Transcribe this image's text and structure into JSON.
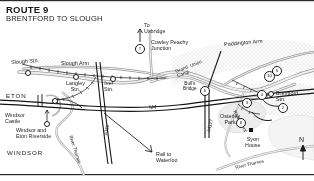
{
  "header": {
    "route_label": "ROUTE 9",
    "route_title": "BRENTFORD TO SLOUGH"
  },
  "map": {
    "north_indicator": "N",
    "labels": {
      "slough_stn": "Slough Stn.",
      "slough_arm": "Slough Arm",
      "langley_stn": "Langley\nStn.",
      "iver_stn": "Iver\nStn.",
      "to_uxbridge": "To\nUxbridge",
      "cowley_peachy_junction": "Cowley Peachy\nJunction",
      "grand_union_canal": "Grand  Union\nCanal",
      "paddington_arm": "Paddington Arm",
      "bulls_bridge": "Bull's\nBridge",
      "brentford_stn": "Brentford\nStn.",
      "osterley_park": "Osterley\nPark",
      "syon_house": "Syon\nHouse",
      "river_brent": "River Brent",
      "river_thames_west": "River Thames",
      "river_thames_east": "River Thames",
      "eton": "ETON",
      "windsor": "WINDSOR",
      "windsor_castle": "Windsor\nCastle",
      "windsor_and_eton_riverside": "Windsor and\nEton Riverside",
      "rail_to_waterloo": "Rail to\nWaterloo",
      "m4": "M4",
      "a355": "A355",
      "a4127": "A4127"
    },
    "markers": [
      {
        "id": "marker-7",
        "label": "7"
      },
      {
        "id": "marker-6",
        "label": "6"
      },
      {
        "id": "marker-5",
        "label": "5"
      },
      {
        "id": "marker-10",
        "label": "10"
      },
      {
        "id": "marker-4",
        "label": "4"
      },
      {
        "id": "marker-3",
        "label": "3"
      },
      {
        "id": "marker-2",
        "label": "2"
      },
      {
        "id": "marker-8",
        "label": "8"
      }
    ]
  },
  "colors": {
    "ink": "#1a1a1a",
    "canal_fill": "#e8e8e8",
    "canal_edge": "#8d8d8d",
    "land_tint": "#f2f2f2",
    "road_line": "#1a1a1a",
    "paper": "#ffffff"
  }
}
